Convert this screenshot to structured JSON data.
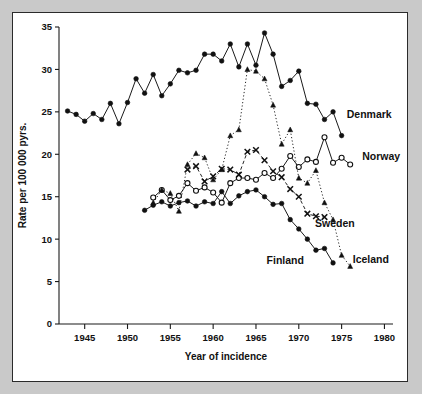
{
  "figure": {
    "background_color": "#c9c9c9",
    "panel_color": "#ffffff",
    "border_color": "#2b2b2b"
  },
  "chart_data": {
    "type": "line",
    "title": "",
    "xlabel": "Year of incidence",
    "ylabel": "Rate per 100 000 pyrs.",
    "xlim": [
      1942,
      1981
    ],
    "ylim": [
      0,
      35
    ],
    "xticks": [
      1945,
      1950,
      1955,
      1960,
      1965,
      1970,
      1975,
      1980
    ],
    "xtick_labels": [
      "1945",
      "1950",
      "1955",
      "1960",
      "1965",
      "1970",
      "1975",
      "1980"
    ],
    "yticks": [
      0,
      5,
      10,
      15,
      20,
      25,
      30,
      35
    ],
    "ytick_labels": [
      "0",
      "5",
      "10",
      "15",
      "20",
      "25",
      "30",
      "35"
    ],
    "grid": false,
    "legend_position": "inline-end-of-line",
    "series": [
      {
        "name": "Denmark",
        "marker": "filled-circle",
        "line_style": "solid",
        "color": "#111111",
        "label_x": 1975.6,
        "label_y": 24.3,
        "x": [
          1943,
          1944,
          1945,
          1946,
          1947,
          1948,
          1949,
          1950,
          1951,
          1952,
          1953,
          1954,
          1955,
          1956,
          1957,
          1958,
          1959,
          1960,
          1961,
          1962,
          1963,
          1964,
          1965,
          1966,
          1967,
          1968,
          1969,
          1970,
          1971,
          1972,
          1973,
          1974,
          1975
        ],
        "y": [
          25.1,
          24.7,
          23.9,
          24.8,
          24.1,
          26.0,
          23.6,
          26.1,
          28.9,
          27.2,
          29.4,
          26.9,
          28.3,
          29.9,
          29.6,
          29.9,
          31.8,
          31.8,
          31.0,
          33.0,
          30.3,
          33.0,
          30.5,
          34.3,
          31.8,
          28.0,
          28.7,
          29.8,
          26.0,
          25.9,
          24.1,
          25.0,
          22.2
        ]
      },
      {
        "name": "Norway",
        "marker": "open-circle",
        "line_style": "solid",
        "color": "#111111",
        "label_x": 1977.4,
        "label_y": 19.3,
        "x": [
          1953,
          1954,
          1955,
          1956,
          1957,
          1958,
          1959,
          1960,
          1961,
          1962,
          1963,
          1964,
          1965,
          1966,
          1967,
          1968,
          1969,
          1970,
          1971,
          1972,
          1973,
          1974,
          1975,
          1976
        ],
        "y": [
          14.9,
          15.8,
          14.6,
          15.1,
          16.6,
          15.7,
          16.1,
          15.5,
          14.3,
          16.6,
          17.2,
          17.2,
          17.0,
          17.8,
          17.2,
          18.3,
          19.8,
          18.5,
          19.4,
          19.1,
          22.0,
          19.0,
          19.6,
          18.8
        ]
      },
      {
        "name": "Sweden",
        "marker": "filled-circle",
        "line_style": "solid",
        "color": "#111111",
        "label_x": 1971.9,
        "label_y": 11.4,
        "x": [
          1952,
          1953,
          1954,
          1955,
          1956,
          1957,
          1958,
          1959,
          1960,
          1961,
          1962,
          1963,
          1964,
          1965,
          1966,
          1967,
          1968,
          1969,
          1970,
          1971,
          1972,
          1973,
          1974
        ],
        "y": [
          13.4,
          14.0,
          14.4,
          13.9,
          14.3,
          14.5,
          13.9,
          14.4,
          14.2,
          15.6,
          14.2,
          15.1,
          15.6,
          15.8,
          15.0,
          14.1,
          14.2,
          12.3,
          11.2,
          10.0,
          8.7,
          8.9,
          7.2
        ]
      },
      {
        "name": "Finland",
        "marker": "x-cross",
        "line_style": "dashed",
        "color": "#111111",
        "label_x": 1970.6,
        "label_y": 7.1,
        "x": [
          1957,
          1958,
          1959,
          1960,
          1961,
          1962,
          1963,
          1964,
          1965,
          1966,
          1967,
          1968,
          1969,
          1970,
          1971,
          1972,
          1973
        ],
        "y": [
          18.2,
          18.6,
          16.8,
          17.4,
          18.3,
          18.2,
          17.6,
          20.3,
          20.5,
          19.3,
          18.0,
          17.3,
          15.9,
          15.0,
          13.0,
          12.7,
          12.6
        ]
      },
      {
        "name": "Iceland",
        "marker": "triangle",
        "line_style": "dotted",
        "color": "#111111",
        "label_x": 1976.3,
        "label_y": 7.2,
        "x": [
          1953,
          1954,
          1955,
          1956,
          1957,
          1958,
          1959,
          1960,
          1961,
          1962,
          1963,
          1964,
          1965,
          1966,
          1967,
          1968,
          1969,
          1970,
          1971,
          1972,
          1973,
          1974,
          1975,
          1976
        ],
        "y": [
          14.3,
          15.8,
          15.4,
          13.3,
          18.8,
          20.1,
          19.6,
          17.0,
          18.2,
          22.2,
          22.9,
          30.0,
          29.8,
          28.9,
          25.8,
          21.2,
          22.9,
          17.2,
          16.6,
          18.1,
          14.3,
          12.3,
          8.1,
          6.8
        ]
      }
    ]
  }
}
